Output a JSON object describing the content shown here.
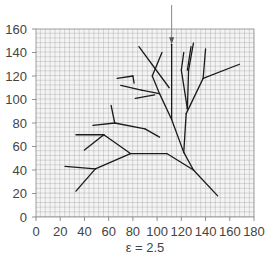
{
  "chart_data": {
    "type": "line",
    "title": "",
    "caption": "ε = 2.5",
    "xlabel": "",
    "ylabel": "",
    "xlim": [
      0,
      180
    ],
    "ylim": [
      0,
      160
    ],
    "x_ticks": [
      0,
      20,
      40,
      60,
      80,
      100,
      120,
      140,
      160,
      180
    ],
    "y_ticks": [
      0,
      20,
      40,
      60,
      80,
      100,
      120,
      140,
      160
    ],
    "grid": true,
    "grid_step": 4,
    "arrow": {
      "x": 112,
      "y_from": 180,
      "y_to": 147
    },
    "segments": [
      [
        [
          112,
          147
        ],
        [
          112,
          83
        ]
      ],
      [
        [
          112,
          83
        ],
        [
          122,
          55
        ]
      ],
      [
        [
          104,
          140
        ],
        [
          96,
          120
        ]
      ],
      [
        [
          96,
          120
        ],
        [
          102,
          105
        ]
      ],
      [
        [
          102,
          105
        ],
        [
          112,
          83
        ]
      ],
      [
        [
          85,
          145
        ],
        [
          110,
          110
        ]
      ],
      [
        [
          122,
          140
        ],
        [
          120,
          125
        ]
      ],
      [
        [
          120,
          125
        ],
        [
          125,
          92
        ]
      ],
      [
        [
          130,
          148
        ],
        [
          126,
          125
        ]
      ],
      [
        [
          126,
          125
        ],
        [
          125,
          92
        ]
      ],
      [
        [
          128,
          145
        ],
        [
          125,
          125
        ]
      ],
      [
        [
          140,
          143
        ],
        [
          138,
          118
        ]
      ],
      [
        [
          138,
          118
        ],
        [
          124,
          88
        ]
      ],
      [
        [
          138,
          118
        ],
        [
          168,
          130
        ]
      ],
      [
        [
          124,
          88
        ],
        [
          122,
          55
        ]
      ],
      [
        [
          67,
          118
        ],
        [
          80,
          120
        ]
      ],
      [
        [
          80,
          120
        ],
        [
          81,
          114
        ]
      ],
      [
        [
          70,
          112
        ],
        [
          87,
          108
        ]
      ],
      [
        [
          87,
          108
        ],
        [
          102,
          105
        ]
      ],
      [
        [
          82,
          101
        ],
        [
          98,
          104
        ]
      ],
      [
        [
          62,
          95
        ],
        [
          65,
          80
        ]
      ],
      [
        [
          65,
          80
        ],
        [
          90,
          75
        ]
      ],
      [
        [
          90,
          75
        ],
        [
          102,
          68
        ]
      ],
      [
        [
          47,
          78
        ],
        [
          65,
          80
        ]
      ],
      [
        [
          33,
          70
        ],
        [
          56,
          70
        ]
      ],
      [
        [
          56,
          70
        ],
        [
          78,
          54
        ]
      ],
      [
        [
          40,
          57
        ],
        [
          56,
          70
        ]
      ],
      [
        [
          78,
          54
        ],
        [
          108,
          54
        ]
      ],
      [
        [
          108,
          54
        ],
        [
          130,
          40
        ]
      ],
      [
        [
          130,
          40
        ],
        [
          150,
          18
        ]
      ],
      [
        [
          122,
          55
        ],
        [
          130,
          40
        ]
      ],
      [
        [
          24,
          43
        ],
        [
          49,
          41
        ]
      ],
      [
        [
          49,
          41
        ],
        [
          78,
          54
        ]
      ],
      [
        [
          33,
          22
        ],
        [
          49,
          41
        ]
      ]
    ]
  }
}
